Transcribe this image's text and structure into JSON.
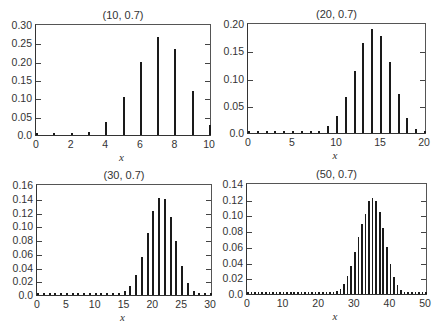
{
  "chart_data": [
    {
      "type": "bar",
      "title": "(10, 0.7)",
      "xlabel": "x",
      "ylabel": "",
      "xlim": [
        0,
        10
      ],
      "ylim": [
        0,
        0.3
      ],
      "xticks": [
        "0",
        "2",
        "4",
        "6",
        "8",
        "10"
      ],
      "yticks": [
        "0.0",
        "0.05",
        "0.10",
        "0.15",
        "0.20",
        "0.25",
        "0.30"
      ],
      "x": [
        0,
        1,
        2,
        3,
        4,
        5,
        6,
        7,
        8,
        9,
        10
      ],
      "values": [
        0.0,
        0.0001,
        0.0014,
        0.009,
        0.0368,
        0.1029,
        0.2001,
        0.2668,
        0.2335,
        0.1211,
        0.0282
      ],
      "grid": false
    },
    {
      "type": "bar",
      "title": "(20, 0.7)",
      "xlabel": "x",
      "ylabel": "",
      "xlim": [
        0,
        20
      ],
      "ylim": [
        0,
        0.2
      ],
      "xticks": [
        "0",
        "5",
        "10",
        "15",
        "20"
      ],
      "yticks": [
        "0.0",
        "0.05",
        "0.10",
        "0.15",
        "0.20"
      ],
      "x": [
        0,
        1,
        2,
        3,
        4,
        5,
        6,
        7,
        8,
        9,
        10,
        11,
        12,
        13,
        14,
        15,
        16,
        17,
        18,
        19,
        20
      ],
      "values": [
        0.0,
        0.0,
        0.0,
        0.0,
        0.0,
        0.0,
        0.0002,
        0.001,
        0.0039,
        0.012,
        0.0308,
        0.0654,
        0.1144,
        0.1643,
        0.1916,
        0.1789,
        0.1304,
        0.0716,
        0.0278,
        0.0068,
        0.0008
      ],
      "grid": false
    },
    {
      "type": "bar",
      "title": "(30, 0.7)",
      "xlabel": "x",
      "ylabel": "",
      "xlim": [
        0,
        30
      ],
      "ylim": [
        0,
        0.16
      ],
      "xticks": [
        "0",
        "5",
        "10",
        "15",
        "20",
        "25",
        "30"
      ],
      "yticks": [
        "0.0",
        "0.02",
        "0.04",
        "0.06",
        "0.08",
        "0.10",
        "0.12",
        "0.14",
        "0.16"
      ],
      "x": [
        0,
        1,
        2,
        3,
        4,
        5,
        6,
        7,
        8,
        9,
        10,
        11,
        12,
        13,
        14,
        15,
        16,
        17,
        18,
        19,
        20,
        21,
        22,
        23,
        24,
        25,
        26,
        27,
        28,
        29,
        30
      ],
      "values": [
        0,
        0,
        0,
        0,
        0,
        0,
        0,
        0,
        0,
        0,
        0,
        0,
        0.0002,
        0.0006,
        0.0019,
        0.0055,
        0.0138,
        0.0298,
        0.0558,
        0.0895,
        0.1219,
        0.1416,
        0.1396,
        0.1138,
        0.0782,
        0.0428,
        0.0181,
        0.0063,
        0.0015,
        0.0003,
        0.0
      ],
      "grid": false
    },
    {
      "type": "bar",
      "title": "(50, 0.7)",
      "xlabel": "x",
      "ylabel": "",
      "xlim": [
        0,
        50
      ],
      "ylim": [
        0,
        0.14
      ],
      "xticks": [
        "0",
        "10",
        "20",
        "30",
        "40",
        "50"
      ],
      "yticks": [
        "0.0",
        "0.02",
        "0.04",
        "0.06",
        "0.08",
        "0.10",
        "0.12",
        "0.14"
      ],
      "x": [
        0,
        1,
        2,
        3,
        4,
        5,
        6,
        7,
        8,
        9,
        10,
        11,
        12,
        13,
        14,
        15,
        16,
        17,
        18,
        19,
        20,
        21,
        22,
        23,
        24,
        25,
        26,
        27,
        28,
        29,
        30,
        31,
        32,
        33,
        34,
        35,
        36,
        37,
        38,
        39,
        40,
        41,
        42,
        43,
        44,
        45,
        46,
        47,
        48,
        49,
        50
      ],
      "values": [
        0,
        0,
        0,
        0,
        0,
        0,
        0,
        0,
        0,
        0,
        0,
        0,
        0,
        0,
        0,
        0,
        0,
        0,
        0,
        0,
        0,
        0.0001,
        0.0002,
        0.0006,
        0.0015,
        0.0033,
        0.0068,
        0.0128,
        0.0223,
        0.0359,
        0.053,
        0.072,
        0.0892,
        0.1018,
        0.1182,
        0.1223,
        0.1189,
        0.105,
        0.0839,
        0.0602,
        0.0386,
        0.0219,
        0.0109,
        0.0047,
        0.0017,
        0.0005,
        0.0001,
        0,
        0,
        0,
        0
      ],
      "grid": false
    }
  ]
}
